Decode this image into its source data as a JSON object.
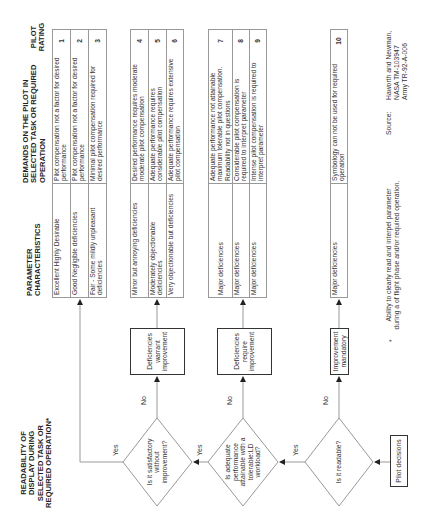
{
  "title": "READABILITY OF DISPLAY DURING SELECTED TASK OR REQUIRED OPERATION*",
  "headers": {
    "parameter": "PARAMETER CHARACTERISTICS",
    "demands": "DEMANDS ON THE PILOT IN SELECTED TASK OR REQUIRED OPERATION",
    "rating": "PILOT RATING"
  },
  "decisions": {
    "start": "Pilot decisions",
    "q1": "Is it readable?",
    "q2": "Is adequate performance attainable with a tolerable:LD workload?",
    "q3": "Is it satisfactory without improvement?",
    "yes": "Yes",
    "no": "No"
  },
  "outcomes": {
    "mandatory": "Improvement mandatory",
    "require": "Deficiencies require improvement",
    "warrant": "Deficiencies warrant improvement"
  },
  "tables": [
    {
      "rows": [
        {
          "parameter": "Excellent Highly Desirable",
          "demands": "Pilot compensation not a factor for desired performance",
          "rating": "1"
        },
        {
          "parameter": "Good Negligible deficiencies",
          "demands": "Pilot compensation not a factor for desired performance",
          "rating": "2"
        },
        {
          "parameter": "Fair - Some mildly unpleasant deficiencies",
          "demands": "Minimal pilot compensation required for desired performance",
          "rating": "3"
        }
      ]
    },
    {
      "rows": [
        {
          "parameter": "Minor but annoying deficiencies",
          "demands": "Desired performance requires moderate moderate pilot compensation",
          "rating": "4"
        },
        {
          "parameter": "Moderately objectionable deficiencies",
          "demands": "Adequate performance requires considerable pilot compensation",
          "rating": "5"
        },
        {
          "parameter": "Very objectionable but deficiencies",
          "demands": "Adequate performance requires extensive pilot compensation",
          "rating": "6"
        }
      ]
    },
    {
      "rows": [
        {
          "parameter": "Major deficiencies",
          "demands": "Adequate performance not attainable maximum tolerable pilot compensation. Readability not in questions",
          "rating": "7"
        },
        {
          "parameter": "Major deficiencies",
          "demands": "Considerable pilot compensation is required to interpret parameter",
          "rating": "8"
        },
        {
          "parameter": "Major deficiencies",
          "demands": "Intense pilot compensation is required to interpret parameter",
          "rating": "9"
        }
      ]
    },
    {
      "rows": [
        {
          "parameter": "Major deficiencies",
          "demands": "Symbology can not be used for required operation",
          "rating": "10"
        }
      ]
    }
  ],
  "footnote": {
    "marker": "*",
    "text": "Ability to clearly read and interpel parameter during a of flight phase and/or required operation."
  },
  "source": {
    "label": "Source:",
    "lines": [
      "Haworth and Newman,",
      "NASA TM-103947",
      "Army TR-92-A-006"
    ]
  }
}
